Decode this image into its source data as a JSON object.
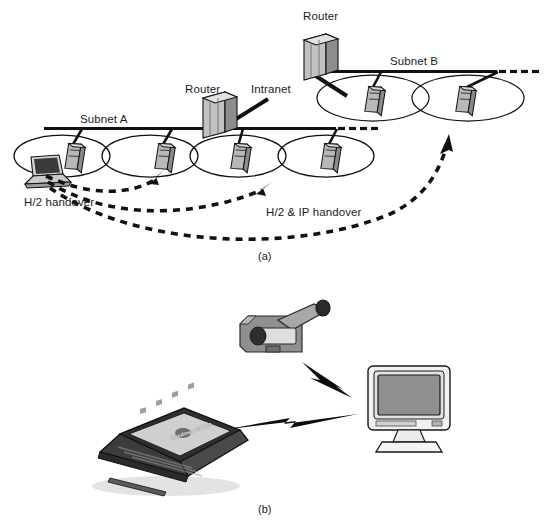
{
  "figure": {
    "panels": [
      {
        "id": "a",
        "caption": "(a)",
        "labels": {
          "router_top": "Router",
          "router_mid": "Router",
          "intranet": "Intranet",
          "subnet_a": "Subnet A",
          "subnet_b": "Subnet B",
          "handover_local": "H/2 handover",
          "handover_ip": "H/2 & IP handover"
        },
        "elements": {
          "routers": 2,
          "base_stations": 6,
          "cells": 7,
          "mobile_terminal": "laptop"
        }
      },
      {
        "id": "b",
        "caption": "(b)",
        "labels": {
          "laptop_screen": "Windows CE 2.0"
        },
        "elements": {
          "camcorder": "camcorder",
          "monitor": "crt-monitor",
          "laptop": "handheld-pc",
          "wireless_links": 2
        }
      }
    ]
  },
  "colors": {
    "line": "#1a1a1a",
    "device_fill": "#b3b3b3",
    "device_light": "#d9d9d9",
    "device_dark": "#7a7a7a",
    "screen": "#8c8c8c",
    "text": "#1b1b1b"
  }
}
